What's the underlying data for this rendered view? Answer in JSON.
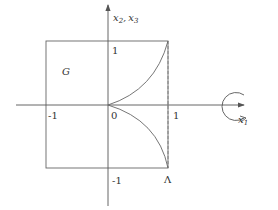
{
  "diagram": {
    "axes": {
      "horizontal_label": "x",
      "horizontal_sub": "1",
      "vertical_label_a": "x",
      "vertical_sub_a": "2",
      "vertical_sep": ",",
      "vertical_label_b": "x",
      "vertical_sub_b": "3"
    },
    "ticks": {
      "x_neg": "-1",
      "origin": "0",
      "x_pos": "1",
      "y_pos": "1",
      "y_neg": "-1"
    },
    "region_label": "G",
    "corner_label": "Λ",
    "colors": {
      "line": "#555555",
      "text": "#333333"
    }
  }
}
